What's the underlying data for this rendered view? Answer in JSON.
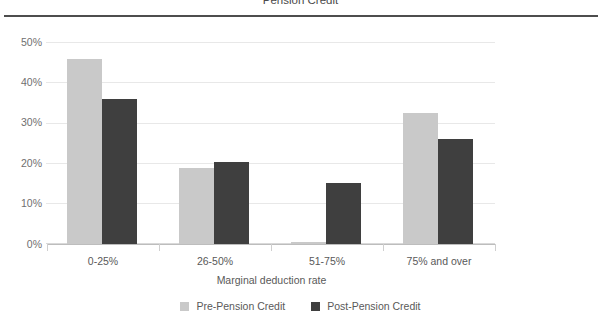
{
  "chart_data": {
    "type": "bar",
    "title": "Pension Credit",
    "xlabel": "Marginal deduction rate",
    "ylabel": "",
    "categories": [
      "0-25%",
      "26-50%",
      "51-75%",
      "75% and over"
    ],
    "series": [
      {
        "name": "Pre-Pension Credit",
        "color": "#c9c9c9",
        "values": [
          46,
          18.8,
          0.5,
          32.7
        ]
      },
      {
        "name": "Post-Pension Credit",
        "color": "#3f3f3f",
        "values": [
          36,
          20.5,
          15.2,
          26
        ]
      }
    ],
    "ylim": [
      0,
      50
    ],
    "yticks": [
      "0%",
      "10%",
      "20%",
      "30%",
      "40%",
      "50%"
    ],
    "ytick_values": [
      0,
      10,
      20,
      30,
      40,
      50
    ],
    "grid": true,
    "legend_position": "bottom"
  },
  "axis": {
    "y_tick_labels": [
      "50%",
      "40%",
      "30%",
      "20%",
      "10%",
      "0%"
    ],
    "x_tick_labels": [
      "0-25%",
      "26-50%",
      "51-75%",
      "75% and over"
    ],
    "x_axis_title": "Marginal deduction rate"
  },
  "legend": {
    "items": [
      {
        "label": "Pre-Pension Credit"
      },
      {
        "label": "Post-Pension Credit"
      }
    ]
  },
  "header": {
    "title": "Pension Credit"
  }
}
